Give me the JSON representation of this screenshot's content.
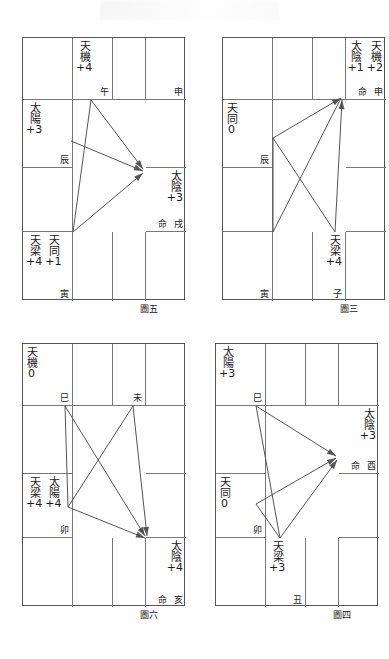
{
  "page": {
    "background": "#ffffff",
    "line_color": "#555555",
    "text_color": "#1a1a1a"
  },
  "charts": [
    {
      "id": "chart-tu-wu",
      "caption": "圖五",
      "position": {
        "left": 22,
        "top": 37,
        "width": 163,
        "height": 263
      },
      "grid": {
        "cols": [
          0,
          50,
          90,
          123,
          163
        ],
        "rows": [
          0,
          62,
          130,
          194,
          263
        ]
      },
      "cells": [
        {
          "name": "cell-r0c0",
          "col": 0,
          "row": 0,
          "stars": [],
          "ming": "",
          "branch": ""
        },
        {
          "name": "cell-r0c1",
          "col": 1,
          "row": 0,
          "stars": [
            {
              "star": "天機",
              "bright": "+4"
            }
          ],
          "ming": "",
          "branch": "午"
        },
        {
          "name": "cell-r0c2",
          "col": 2,
          "row": 0,
          "stars": [],
          "ming": "",
          "branch": ""
        },
        {
          "name": "cell-r0c3",
          "col": 3,
          "row": 0,
          "stars": [],
          "ming": "",
          "branch": "申"
        },
        {
          "name": "cell-r1c0",
          "col": 0,
          "row": 1,
          "stars": [
            {
              "star": "太陽",
              "bright": "+3"
            }
          ],
          "ming": "",
          "branch": "辰"
        },
        {
          "name": "cell-r1c3",
          "col": 3,
          "row": 1,
          "stars": [],
          "ming": "",
          "branch": ""
        },
        {
          "name": "cell-r2c0",
          "col": 0,
          "row": 2,
          "stars": [],
          "ming": "",
          "branch": ""
        },
        {
          "name": "cell-r2c3",
          "col": 3,
          "row": 2,
          "stars": [
            {
              "star": "太陰",
              "bright": "+3"
            }
          ],
          "ming": "命",
          "branch": "戌"
        },
        {
          "name": "cell-r3c0",
          "col": 0,
          "row": 3,
          "stars": [
            {
              "star": "天梁",
              "bright": "+4"
            },
            {
              "star": "天同",
              "bright": "+1"
            }
          ],
          "ming": "",
          "branch": "寅"
        },
        {
          "name": "cell-r3c1",
          "col": 1,
          "row": 3,
          "stars": [],
          "ming": "",
          "branch": ""
        },
        {
          "name": "cell-r3c2",
          "col": 2,
          "row": 3,
          "stars": [],
          "ming": "",
          "branch": ""
        },
        {
          "name": "cell-r3c3",
          "col": 3,
          "row": 3,
          "stars": [],
          "ming": "",
          "branch": ""
        }
      ],
      "arrows": [
        {
          "name": "arrow-wu-to-xu",
          "from": [
            68,
            62
          ],
          "to": [
            120,
            131
          ],
          "head": true
        },
        {
          "name": "arrow-chen-to-xu",
          "from": [
            48,
            103
          ],
          "to": [
            120,
            133
          ],
          "head": true
        },
        {
          "name": "arrow-yin-to-xu",
          "from": [
            50,
            194
          ],
          "to": [
            120,
            135
          ],
          "head": true
        },
        {
          "name": "line-wu-to-yin",
          "from": [
            68,
            62
          ],
          "to": [
            50,
            194
          ],
          "head": false
        }
      ],
      "caption_pos": {
        "left": 118,
        "top": 265
      }
    },
    {
      "id": "chart-tu-san",
      "caption": "圖三",
      "position": {
        "left": 222,
        "top": 37,
        "width": 163,
        "height": 263
      },
      "grid": {
        "cols": [
          0,
          50,
          90,
          123,
          163
        ],
        "rows": [
          0,
          62,
          130,
          194,
          263
        ]
      },
      "cells": [
        {
          "name": "cell-r0c0",
          "col": 0,
          "row": 0,
          "stars": [],
          "ming": "",
          "branch": ""
        },
        {
          "name": "cell-r0c1",
          "col": 1,
          "row": 0,
          "stars": [],
          "ming": "",
          "branch": ""
        },
        {
          "name": "cell-r0c2",
          "col": 2,
          "row": 0,
          "stars": [],
          "ming": "",
          "branch": ""
        },
        {
          "name": "cell-r0c3",
          "col": 3,
          "row": 0,
          "stars": [
            {
              "star": "太陰",
              "bright": "+1"
            },
            {
              "star": "天機",
              "bright": "+2"
            }
          ],
          "ming": "命",
          "branch": "申"
        },
        {
          "name": "cell-r1c0",
          "col": 0,
          "row": 1,
          "stars": [
            {
              "star": "天同",
              "bright": "0"
            }
          ],
          "ming": "",
          "branch": "辰"
        },
        {
          "name": "cell-r1c3",
          "col": 3,
          "row": 1,
          "stars": [],
          "ming": "",
          "branch": ""
        },
        {
          "name": "cell-r2c0",
          "col": 0,
          "row": 2,
          "stars": [],
          "ming": "",
          "branch": ""
        },
        {
          "name": "cell-r2c3",
          "col": 3,
          "row": 2,
          "stars": [],
          "ming": "",
          "branch": ""
        },
        {
          "name": "cell-r3c0",
          "col": 0,
          "row": 3,
          "stars": [],
          "ming": "",
          "branch": "寅"
        },
        {
          "name": "cell-r3c1",
          "col": 1,
          "row": 3,
          "stars": [],
          "ming": "",
          "branch": ""
        },
        {
          "name": "cell-r3c2",
          "col": 2,
          "row": 3,
          "stars": [
            {
              "star": "天梁",
              "bright": "+4"
            }
          ],
          "ming": "",
          "branch": "子"
        },
        {
          "name": "cell-r3c3",
          "col": 3,
          "row": 3,
          "stars": [],
          "ming": "",
          "branch": ""
        }
      ],
      "arrows": [
        {
          "name": "arrow-chen-to-shen",
          "from": [
            50,
            100
          ],
          "to": [
            118,
            60
          ],
          "head": true
        },
        {
          "name": "arrow-zi-to-shen",
          "from": [
            112,
            194
          ],
          "to": [
            119,
            62
          ],
          "head": true
        },
        {
          "name": "line-chen-to-zi",
          "from": [
            50,
            100
          ],
          "to": [
            112,
            194
          ],
          "head": false
        },
        {
          "name": "line-yin-to-shen",
          "from": [
            50,
            194
          ],
          "to": [
            118,
            60
          ],
          "head": false
        },
        {
          "name": "line-chen-to-yin",
          "from": [
            50,
            100
          ],
          "to": [
            50,
            194
          ],
          "head": false
        }
      ],
      "caption_pos": {
        "left": 118,
        "top": 265
      }
    },
    {
      "id": "chart-tu-liu",
      "caption": "圖六",
      "position": {
        "left": 22,
        "top": 343,
        "width": 163,
        "height": 263
      },
      "grid": {
        "cols": [
          0,
          50,
          90,
          123,
          163
        ],
        "rows": [
          0,
          62,
          130,
          194,
          263
        ]
      },
      "cells": [
        {
          "name": "cell-r0c0",
          "col": 0,
          "row": 0,
          "stars": [
            {
              "star": "天機",
              "bright": "0"
            }
          ],
          "ming": "",
          "branch": "巳"
        },
        {
          "name": "cell-r0c1",
          "col": 1,
          "row": 0,
          "stars": [],
          "ming": "",
          "branch": ""
        },
        {
          "name": "cell-r0c2",
          "col": 2,
          "row": 0,
          "stars": [],
          "ming": "",
          "branch": "未"
        },
        {
          "name": "cell-r0c3",
          "col": 3,
          "row": 0,
          "stars": [],
          "ming": "",
          "branch": ""
        },
        {
          "name": "cell-r1c0",
          "col": 0,
          "row": 1,
          "stars": [],
          "ming": "",
          "branch": ""
        },
        {
          "name": "cell-r1c3",
          "col": 3,
          "row": 1,
          "stars": [],
          "ming": "",
          "branch": ""
        },
        {
          "name": "cell-r2c0",
          "col": 0,
          "row": 2,
          "stars": [
            {
              "star": "天梁",
              "bright": "+4"
            },
            {
              "star": "太陽",
              "bright": "+4"
            }
          ],
          "ming": "",
          "branch": "卯"
        },
        {
          "name": "cell-r2c3",
          "col": 3,
          "row": 2,
          "stars": [],
          "ming": "",
          "branch": ""
        },
        {
          "name": "cell-r3c0",
          "col": 0,
          "row": 3,
          "stars": [],
          "ming": "",
          "branch": ""
        },
        {
          "name": "cell-r3c1",
          "col": 1,
          "row": 3,
          "stars": [],
          "ming": "",
          "branch": ""
        },
        {
          "name": "cell-r3c2",
          "col": 2,
          "row": 3,
          "stars": [],
          "ming": "",
          "branch": ""
        },
        {
          "name": "cell-r3c3",
          "col": 3,
          "row": 3,
          "stars": [
            {
              "star": "太陰",
              "bright": "+4"
            }
          ],
          "ming": "命",
          "branch": "亥"
        }
      ],
      "arrows": [
        {
          "name": "arrow-si-to-hai",
          "from": [
            42,
            62
          ],
          "to": [
            122,
            192
          ],
          "head": true
        },
        {
          "name": "arrow-wei-to-hai",
          "from": [
            110,
            62
          ],
          "to": [
            124,
            192
          ],
          "head": true
        },
        {
          "name": "arrow-mao-to-hai",
          "from": [
            45,
            163
          ],
          "to": [
            122,
            194
          ],
          "head": true
        },
        {
          "name": "line-si-to-mao",
          "from": [
            42,
            62
          ],
          "to": [
            45,
            163
          ],
          "head": false
        },
        {
          "name": "line-wei-to-mao",
          "from": [
            110,
            62
          ],
          "to": [
            45,
            163
          ],
          "head": false
        }
      ],
      "caption_pos": {
        "left": 118,
        "top": 265
      }
    },
    {
      "id": "chart-tu-si",
      "caption": "圖四",
      "position": {
        "left": 215,
        "top": 343,
        "width": 163,
        "height": 263
      },
      "grid": {
        "cols": [
          0,
          50,
          90,
          123,
          163
        ],
        "rows": [
          0,
          62,
          130,
          194,
          263
        ]
      },
      "cells": [
        {
          "name": "cell-r0c0",
          "col": 0,
          "row": 0,
          "stars": [
            {
              "star": "太陽",
              "bright": "+3"
            }
          ],
          "ming": "",
          "branch": "巳"
        },
        {
          "name": "cell-r0c1",
          "col": 1,
          "row": 0,
          "stars": [],
          "ming": "",
          "branch": ""
        },
        {
          "name": "cell-r0c2",
          "col": 2,
          "row": 0,
          "stars": [],
          "ming": "",
          "branch": ""
        },
        {
          "name": "cell-r0c3",
          "col": 3,
          "row": 0,
          "stars": [],
          "ming": "",
          "branch": ""
        },
        {
          "name": "cell-r1c0",
          "col": 0,
          "row": 1,
          "stars": [],
          "ming": "",
          "branch": ""
        },
        {
          "name": "cell-r1c3",
          "col": 3,
          "row": 1,
          "stars": [
            {
              "star": "太陰",
              "bright": "+3"
            }
          ],
          "ming": "命",
          "branch": "酉"
        },
        {
          "name": "cell-r2c0",
          "col": 0,
          "row": 2,
          "stars": [
            {
              "star": "天同",
              "bright": "0"
            }
          ],
          "ming": "",
          "branch": "卯"
        },
        {
          "name": "cell-r2c3",
          "col": 3,
          "row": 2,
          "stars": [],
          "ming": "",
          "branch": ""
        },
        {
          "name": "cell-r3c0",
          "col": 0,
          "row": 3,
          "stars": [],
          "ming": "",
          "branch": ""
        },
        {
          "name": "cell-r3c1",
          "col": 1,
          "row": 3,
          "stars": [
            {
              "star": "天梁",
              "bright": "+3"
            }
          ],
          "ming": "",
          "branch": "丑"
        },
        {
          "name": "cell-r3c2",
          "col": 2,
          "row": 3,
          "stars": [],
          "ming": "",
          "branch": ""
        },
        {
          "name": "cell-r3c3",
          "col": 3,
          "row": 3,
          "stars": [],
          "ming": "",
          "branch": ""
        }
      ],
      "arrows": [
        {
          "name": "arrow-si-to-you",
          "from": [
            40,
            62
          ],
          "to": [
            120,
            112
          ],
          "head": true
        },
        {
          "name": "arrow-mao-to-you",
          "from": [
            40,
            160
          ],
          "to": [
            120,
            114
          ],
          "head": true
        },
        {
          "name": "arrow-chou-to-you",
          "from": [
            64,
            194
          ],
          "to": [
            121,
            116
          ],
          "head": true
        },
        {
          "name": "line-si-to-chou",
          "from": [
            40,
            62
          ],
          "to": [
            64,
            194
          ],
          "head": false
        },
        {
          "name": "line-mao-to-chou",
          "from": [
            40,
            160
          ],
          "to": [
            64,
            194
          ],
          "head": false
        }
      ],
      "caption_pos": {
        "left": 118,
        "top": 265
      }
    }
  ]
}
